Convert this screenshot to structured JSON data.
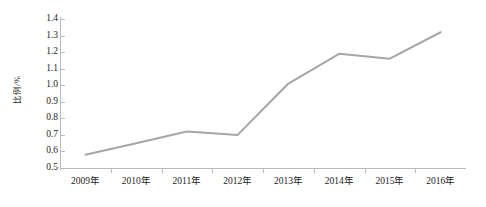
{
  "chart_data": {
    "type": "line",
    "title": "",
    "subtitle": "",
    "xlabel": "",
    "ylabel": "比例/%",
    "categories": [
      "2009年",
      "2010年",
      "2011年",
      "2012年",
      "2013年",
      "2014年",
      "2015年",
      "2016年"
    ],
    "series": [
      {
        "name": "比例",
        "values": [
          0.58,
          0.65,
          0.72,
          0.7,
          1.01,
          1.19,
          1.16,
          1.32
        ]
      }
    ],
    "ylim": [
      0.5,
      1.4
    ],
    "ytick_step": 0.1,
    "ytick_labels": [
      "1.4",
      "1.3",
      "1.2",
      "1.1",
      "1.0",
      "0.9",
      "0.8",
      "0.7",
      "0.6",
      "0.5"
    ],
    "ytick_values": [
      1.4,
      1.3,
      1.2,
      1.1,
      1.0,
      0.9,
      0.8,
      0.7,
      0.6,
      0.5
    ],
    "grid": false,
    "legend": false,
    "legend_position": "none",
    "markers": false,
    "annotations": [],
    "colors": {
      "line": "#a6a6a6",
      "axis": "#b9b9b9",
      "tick": "#bdbdbd",
      "text": "#1c1c1c",
      "background": "#ffffff"
    },
    "line_width": 2.0
  }
}
